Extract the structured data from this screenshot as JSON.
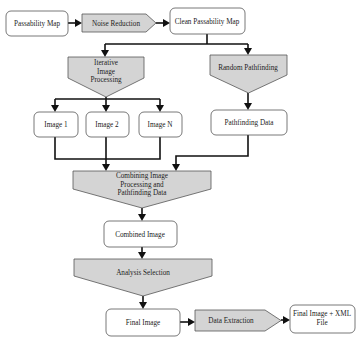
{
  "diagram": {
    "nodes": {
      "passability_map": {
        "lines": [
          "Passability Map"
        ],
        "type": "data"
      },
      "noise_reduction": {
        "lines": [
          "Noise Reduction"
        ],
        "type": "process"
      },
      "clean_passability_map": {
        "lines": [
          "Clean Passability Map"
        ],
        "type": "data"
      },
      "iterative_image_processing": {
        "lines": [
          "Iterative",
          "Image",
          "Processing"
        ],
        "type": "process"
      },
      "random_pathfinding": {
        "lines": [
          "Random Pathfinding"
        ],
        "type": "process"
      },
      "image_1": {
        "lines": [
          "Image 1"
        ],
        "type": "data"
      },
      "image_2": {
        "lines": [
          "Image 2"
        ],
        "type": "data"
      },
      "image_n": {
        "lines": [
          "Image N"
        ],
        "type": "data"
      },
      "pathfinding_data": {
        "lines": [
          "Pathfinding Data"
        ],
        "type": "data"
      },
      "combining": {
        "lines": [
          "Combining Image",
          "Processing and",
          "Pathfinding Data"
        ],
        "type": "process"
      },
      "combined_image": {
        "lines": [
          "Combined Image"
        ],
        "type": "data"
      },
      "analysis_selection": {
        "lines": [
          "Analysis Selection"
        ],
        "type": "process"
      },
      "final_image": {
        "lines": [
          "Final Image"
        ],
        "type": "data"
      },
      "data_extraction": {
        "lines": [
          "Data Extraction"
        ],
        "type": "process"
      },
      "final_image_xml": {
        "lines": [
          "Final Image + XML",
          "File"
        ],
        "type": "data"
      }
    },
    "edges": [
      [
        "passability_map",
        "noise_reduction"
      ],
      [
        "noise_reduction",
        "clean_passability_map"
      ],
      [
        "clean_passability_map",
        "iterative_image_processing"
      ],
      [
        "clean_passability_map",
        "random_pathfinding"
      ],
      [
        "iterative_image_processing",
        "image_1"
      ],
      [
        "iterative_image_processing",
        "image_2"
      ],
      [
        "iterative_image_processing",
        "image_n"
      ],
      [
        "random_pathfinding",
        "pathfinding_data"
      ],
      [
        "image_1",
        "combining"
      ],
      [
        "image_2",
        "combining"
      ],
      [
        "image_n",
        "combining"
      ],
      [
        "pathfinding_data",
        "combining"
      ],
      [
        "combining",
        "combined_image"
      ],
      [
        "combined_image",
        "analysis_selection"
      ],
      [
        "analysis_selection",
        "final_image"
      ],
      [
        "final_image",
        "data_extraction"
      ],
      [
        "data_extraction",
        "final_image_xml"
      ]
    ],
    "colors": {
      "process_fill": "#d4d4d4",
      "data_fill": "#ffffff",
      "stroke": "#555555",
      "connector": "#111111"
    }
  }
}
